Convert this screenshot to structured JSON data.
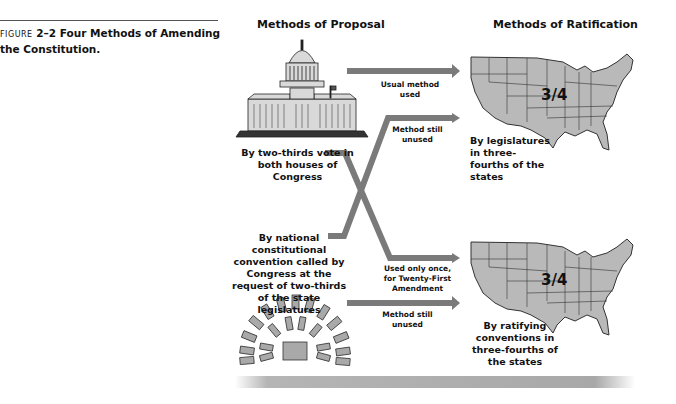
{
  "figure": {
    "label": "FIGURE",
    "number": "2–2",
    "title": "Four Methods of Amending the Constitution."
  },
  "columns": {
    "proposal": "Methods of Proposal",
    "ratification": "Methods of Ratification"
  },
  "proposal_methods": [
    {
      "label": "By two-thirds vote in both houses of Congress",
      "icon": "capitol-building-icon"
    },
    {
      "label": "By national constitutional convention called by Congress at the request of two-thirds of the state legislatures",
      "icon": "convention-seating-icon"
    }
  ],
  "ratification_methods": [
    {
      "label": "By legislatures in three-fourths of the states",
      "map_fraction": "3/4",
      "icon": "us-map-icon"
    },
    {
      "label": "By ratifying conventions in three-fourths of the states",
      "map_fraction": "3/4",
      "icon": "us-map-icon"
    }
  ],
  "arrows": [
    {
      "from": "Congress",
      "to": "State legislatures",
      "note": "Usual method used"
    },
    {
      "from": "National convention",
      "to": "State legislatures",
      "note": "Method still unused"
    },
    {
      "from": "Congress",
      "to": "State conventions",
      "note": "Used only once, for Twenty-First Amendment"
    },
    {
      "from": "National convention",
      "to": "State conventions",
      "note": "Method still unused"
    }
  ],
  "colors": {
    "arrow": "#7a7a7a",
    "map_fill": "#b9b9b9",
    "map_stroke": "#333333",
    "seat_fill": "#a9a9a9"
  }
}
